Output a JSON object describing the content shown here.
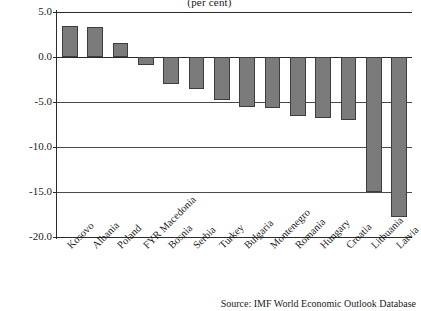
{
  "chart_data": {
    "type": "bar",
    "title": "(per cent)",
    "xlabel": "",
    "ylabel": "",
    "ylim": [
      -20.0,
      5.0
    ],
    "ytick_labels": [
      "5.0",
      "0.0",
      "-5.0",
      "-10.0",
      "-15.0",
      "-20.0"
    ],
    "ytick_values": [
      5.0,
      0.0,
      -5.0,
      -10.0,
      -15.0,
      -20.0
    ],
    "grid": true,
    "legend": "none",
    "bar_color": "#7b7b7b",
    "bar_edge_color": "#3d3d3d",
    "categories": [
      "Kosovo",
      "Albania",
      "Poland",
      "FYR Macedonia",
      "Bosnia",
      "Serbia",
      "Turkey",
      "Bulgaria",
      "Montenegro",
      "Romania",
      "Hungary",
      "Croatia",
      "Lithuania",
      "Latvia"
    ],
    "values": [
      3.5,
      3.3,
      1.6,
      -0.9,
      -3.0,
      -3.5,
      -4.8,
      -5.5,
      -5.7,
      -6.6,
      -6.8,
      -7.0,
      -15.0,
      -17.8
    ]
  },
  "source": {
    "text": "Source: IMF World Economic Outlook Database"
  }
}
